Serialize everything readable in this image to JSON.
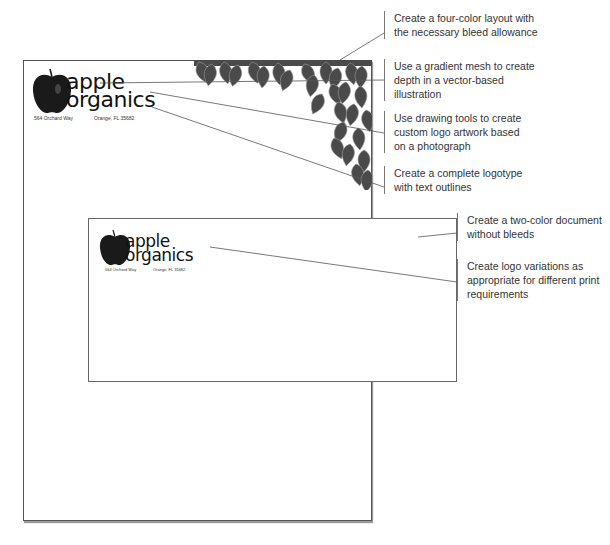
{
  "letterhead": {
    "logo": {
      "word1": "apple",
      "word2": "organics"
    },
    "address_street": "564 Orchard Way",
    "address_city": "Orange, FL 35682"
  },
  "envelope": {
    "logo": {
      "word1": "apple",
      "word2": "organics"
    },
    "address_street": "564 Orchard Way",
    "address_city": "Orange, FL 35682"
  },
  "callouts": [
    {
      "id": "four-color",
      "text": "Create a four-color layout with the necessary bleed allowance"
    },
    {
      "id": "gradient-mesh",
      "text": "Use a gradient mesh to create depth in a vector-based illustration"
    },
    {
      "id": "drawing-tools",
      "text": "Use drawing tools to create custom logo artwork based on a photograph"
    },
    {
      "id": "logotype",
      "text": "Create a complete logotype with text outlines"
    },
    {
      "id": "two-color",
      "text": "Create a two-color document without bleeds"
    },
    {
      "id": "logo-variations",
      "text": "Create logo variations as appropriate for different print requirements"
    }
  ],
  "colors": {
    "leaf": "#4a4a4a",
    "leaf_vein": "#9a9a9a",
    "line": "#555555",
    "apple": "#1a1a1a"
  }
}
